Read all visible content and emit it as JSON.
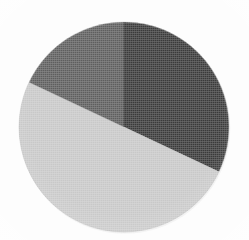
{
  "figure": {
    "background_color": "#fdfdfd",
    "has_title": false,
    "has_legend": false,
    "has_labels": false,
    "has_border": false
  },
  "geometry": {
    "center_x": 124,
    "center_y": 127,
    "radius": 105,
    "start_angle_deg": 0,
    "direction": "clockwise"
  },
  "chart_data": {
    "type": "pie",
    "title": "",
    "subtitle": "",
    "xlabel": "",
    "ylabel": "",
    "grid": false,
    "legend_position": "none",
    "categories": [
      "Slice 1",
      "Slice 2",
      "Slice 3"
    ],
    "values": [
      32,
      50,
      18
    ],
    "units": "percent",
    "total": 100,
    "start_angle_deg": 0,
    "direction": "clockwise",
    "colors": [
      "#3a3a3a",
      "#c8c8c8",
      "#5e5e5e"
    ],
    "slices": [
      {
        "label": "Slice 1",
        "value": 32,
        "percent": 32,
        "color": "#3a3a3a",
        "shade": "dark",
        "start_angle_deg": 0,
        "end_angle_deg": 115.2,
        "sweep_deg": 115.2,
        "path": "M 124 127 L 124 22 A 105 105 0 0 1 219.0 172.5 Z"
      },
      {
        "label": "Slice 2",
        "value": 50,
        "percent": 50,
        "color": "#c8c8c8",
        "shade": "light",
        "start_angle_deg": 115.2,
        "end_angle_deg": 295.2,
        "sweep_deg": 180.0,
        "path": "M 124 127 L 219.0 172.5 A 105 105 0 0 1 29.0 81.5 Z"
      },
      {
        "label": "Slice 3",
        "value": 18,
        "percent": 18,
        "color": "#5e5e5e",
        "shade": "medium",
        "start_angle_deg": 295.2,
        "end_angle_deg": 360,
        "sweep_deg": 64.8,
        "path": "M 124 127 L 29.0 81.5 A 105 105 0 0 1 124 22 Z"
      }
    ]
  }
}
